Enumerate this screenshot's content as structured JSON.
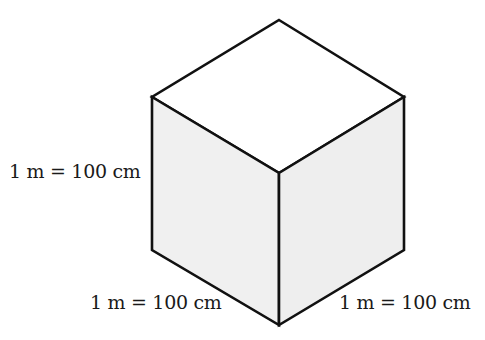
{
  "figure": {
    "type": "isometric-cube",
    "colors": {
      "stroke": "#111111",
      "top_face": "#ffffff",
      "left_face": "#f0f0f0",
      "right_face": "#eeeeee",
      "background": "#ffffff"
    },
    "labels": {
      "height": "1 m = 100 cm",
      "left_edge": "1 m = 100 cm",
      "right_edge": "1 m = 100 cm"
    }
  }
}
